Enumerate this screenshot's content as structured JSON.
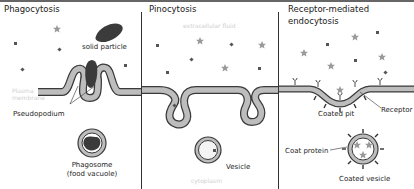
{
  "figure": {
    "colors": {
      "membrane_fill": "#bdbdbd",
      "membrane_outline": "#3a3a3a",
      "particle": "#3b3b3b",
      "star": "#9a9a9a",
      "dot": "#555555",
      "divider": "#333333",
      "faint_label": "#cfcfcf"
    },
    "panels": [
      {
        "title": "Phagocytosis",
        "labels": {
          "solid_particle": "solid particle",
          "plasma_membrane": "Plasma membrane",
          "pseudopodium": "Pseudopodium",
          "phagosome": "Phagosome",
          "phagosome_sub": "(food vacuole)"
        }
      },
      {
        "title": "Pinocytosis",
        "labels": {
          "extracellular_fluid": "extracellular fluid",
          "vesicle": "Vesicle",
          "cytoplasm": "cytoplasm"
        }
      },
      {
        "title_line1": "Receptor-mediated",
        "title_line2": "endocytosis",
        "labels": {
          "coated_pit": "Coated pit",
          "receptor": "Receptor",
          "coat_protein": "Coat protein",
          "coated_vesicle": "Coated vesicle"
        }
      }
    ]
  }
}
